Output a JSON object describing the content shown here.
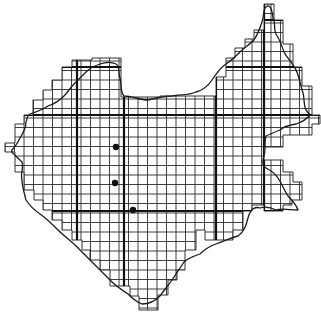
{
  "map": {
    "type": "grid-map",
    "description": "Region outline overlaid with square grid cells; three sample location dots",
    "colors": {
      "background": "#ffffff",
      "grid": "#2a2a2a",
      "border": "#1a1a1a",
      "dots": "#111111"
    },
    "grid_cell_px": 9.5,
    "thick_lines": {
      "vertical_x": [
        77,
        124,
        216,
        264
      ],
      "horizontal_y": [
        20,
        67,
        115,
        211
      ]
    },
    "dots": [
      {
        "id": "dot-1",
        "x": 116,
        "y": 147
      },
      {
        "id": "dot-2",
        "x": 115,
        "y": 183
      },
      {
        "id": "dot-3",
        "x": 133,
        "y": 210
      }
    ]
  }
}
